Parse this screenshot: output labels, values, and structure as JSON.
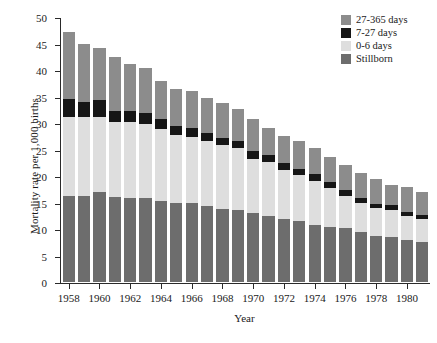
{
  "chart_data": {
    "type": "bar",
    "stacked": true,
    "title": "",
    "xlabel": "Year",
    "ylabel": "Mortality rate per 1,000 births",
    "ylim": [
      0,
      50
    ],
    "ytick_step": 5,
    "yticks": [
      0,
      5,
      10,
      15,
      20,
      25,
      30,
      35,
      40,
      45,
      50
    ],
    "grid": false,
    "legend_position": "top-right",
    "xtick_labels": [
      "1958",
      "1960",
      "1962",
      "1964",
      "1966",
      "1968",
      "1970",
      "1972",
      "1974",
      "1976",
      "1978",
      "1980"
    ],
    "categories": [
      "1958",
      "1959",
      "1960",
      "1961",
      "1962",
      "1963",
      "1964",
      "1965",
      "1966",
      "1967",
      "1968",
      "1969",
      "1970",
      "1971",
      "1972",
      "1973",
      "1974",
      "1975",
      "1976",
      "1977",
      "1978",
      "1979",
      "1980",
      "1981"
    ],
    "series": [
      {
        "name": "Stillborn",
        "color": "#6d6d6d",
        "values": [
          16.3,
          16.3,
          17.0,
          16.1,
          15.9,
          15.8,
          15.2,
          14.9,
          14.9,
          14.3,
          13.8,
          13.5,
          13.1,
          12.5,
          11.9,
          11.6,
          10.8,
          10.3,
          10.1,
          9.4,
          8.7,
          8.5,
          7.9,
          7.6
        ]
      },
      {
        "name": "0-6 days",
        "color": "#dedede",
        "values": [
          14.9,
          14.8,
          14.2,
          14.1,
          14.2,
          14.0,
          13.6,
          12.9,
          12.5,
          12.4,
          12.0,
          11.8,
          10.2,
          10.1,
          9.3,
          8.6,
          8.3,
          7.5,
          6.2,
          5.5,
          5.2,
          5.1,
          4.5,
          4.3
        ]
      },
      {
        "name": "7-27 days",
        "color": "#161616",
        "values": [
          3.3,
          2.8,
          3.1,
          2.1,
          2.1,
          2.1,
          1.9,
          1.6,
          1.6,
          1.4,
          1.4,
          1.4,
          1.4,
          1.4,
          1.2,
          1.2,
          1.2,
          1.1,
          1.0,
          1.0,
          0.9,
          0.9,
          0.9,
          0.8
        ]
      },
      {
        "name": "27-365 days",
        "color": "#8c8c8c",
        "values": [
          12.6,
          11.1,
          9.9,
          10.2,
          8.9,
          8.4,
          7.3,
          7.1,
          7.0,
          6.6,
          6.6,
          5.9,
          6.0,
          5.1,
          5.2,
          5.3,
          5.0,
          4.7,
          4.8,
          4.6,
          4.7,
          3.9,
          4.6,
          4.2
        ]
      }
    ],
    "legend": [
      {
        "label": "27-365 days",
        "color": "#8c8c8c"
      },
      {
        "label": "7-27 days",
        "color": "#161616"
      },
      {
        "label": "0-6 days",
        "color": "#dedede"
      },
      {
        "label": "Stillborn",
        "color": "#6d6d6d"
      }
    ]
  }
}
